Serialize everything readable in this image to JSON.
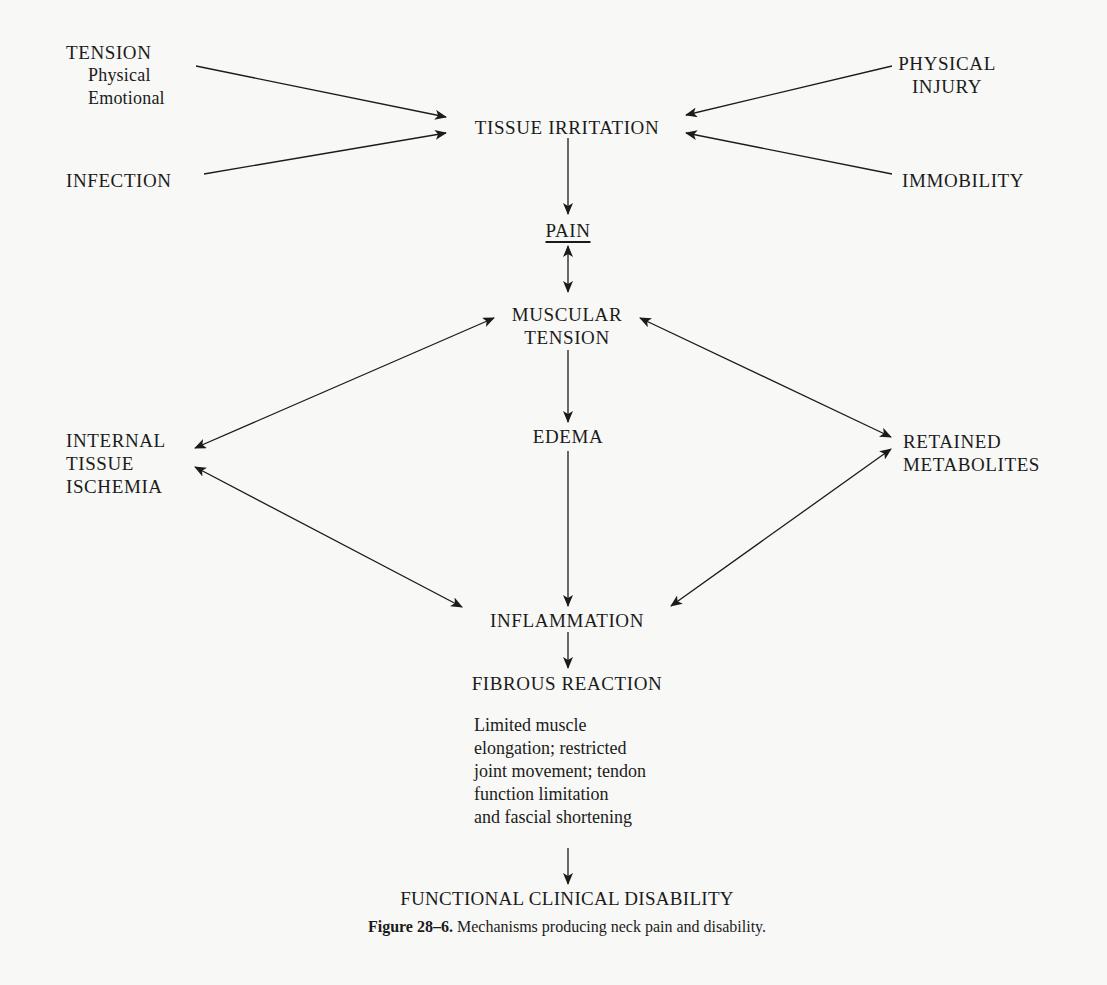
{
  "figure": {
    "caption_label": "Figure 28–6.",
    "caption_text": " Mechanisms producing neck pain and disability."
  },
  "nodes": {
    "tension": {
      "title": "TENSION",
      "sub1": "Physical",
      "sub2": "Emotional"
    },
    "infection": {
      "title": "INFECTION"
    },
    "physical_injury": {
      "line1": "PHYSICAL",
      "line2": "INJURY"
    },
    "immobility": {
      "title": "IMMOBILITY"
    },
    "tissue_irritation": {
      "title": "TISSUE IRRITATION"
    },
    "pain": {
      "title": "PAIN"
    },
    "muscular_tension": {
      "line1": "MUSCULAR",
      "line2": "TENSION"
    },
    "edema": {
      "title": "EDEMA"
    },
    "internal_tissue_ischemia": {
      "line1": "INTERNAL",
      "line2": "TISSUE",
      "line3": "ISCHEMIA"
    },
    "retained_metabolites": {
      "line1": "RETAINED",
      "line2": "METABOLITES"
    },
    "inflammation": {
      "title": "INFLAMMATION"
    },
    "fibrous_reaction": {
      "title": "FIBROUS REACTION"
    },
    "fibrous_description": {
      "lines": [
        "Limited muscle",
        "elongation; restricted",
        "joint movement; tendon",
        "function limitation",
        "and fascial shortening"
      ]
    },
    "functional_clinical_disability": {
      "title": "FUNCTIONAL CLINICAL DISABILITY"
    }
  },
  "edges": [
    {
      "from": "TENSION",
      "to": "TISSUE IRRITATION",
      "direction": "forward"
    },
    {
      "from": "INFECTION",
      "to": "TISSUE IRRITATION",
      "direction": "forward"
    },
    {
      "from": "PHYSICAL INJURY",
      "to": "TISSUE IRRITATION",
      "direction": "forward"
    },
    {
      "from": "IMMOBILITY",
      "to": "TISSUE IRRITATION",
      "direction": "forward"
    },
    {
      "from": "TISSUE IRRITATION",
      "to": "PAIN",
      "direction": "forward"
    },
    {
      "from": "PAIN",
      "to": "MUSCULAR TENSION",
      "direction": "both"
    },
    {
      "from": "MUSCULAR TENSION",
      "to": "EDEMA",
      "direction": "forward"
    },
    {
      "from": "MUSCULAR TENSION",
      "to": "INTERNAL TISSUE ISCHEMIA",
      "direction": "both"
    },
    {
      "from": "MUSCULAR TENSION",
      "to": "RETAINED METABOLITES",
      "direction": "both"
    },
    {
      "from": "EDEMA",
      "to": "INFLAMMATION",
      "direction": "forward"
    },
    {
      "from": "INTERNAL TISSUE ISCHEMIA",
      "to": "INFLAMMATION",
      "direction": "both"
    },
    {
      "from": "RETAINED METABOLITES",
      "to": "INFLAMMATION",
      "direction": "both"
    },
    {
      "from": "INFLAMMATION",
      "to": "FIBROUS REACTION",
      "direction": "forward"
    },
    {
      "from": "FIBROUS REACTION",
      "to": "FUNCTIONAL CLINICAL DISABILITY",
      "direction": "forward"
    }
  ],
  "colors": {
    "ink": "#1b1b1b",
    "paper": "#f8f8f6"
  }
}
